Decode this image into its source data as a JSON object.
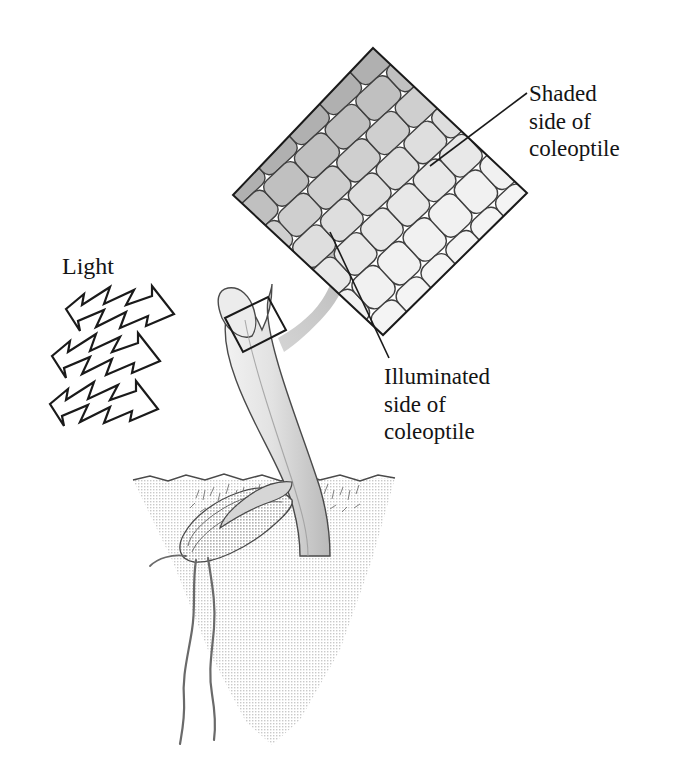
{
  "figure": {
    "labels": {
      "light": "Light",
      "shaded": "Shaded\nside of\ncoleoptile",
      "illuminated": "Illuminated\nside of\ncoleoptile"
    },
    "colors": {
      "outline": "#1a1a1a",
      "background": "#ffffff",
      "soil": "#e3e3e3",
      "plant": "#e0e0e0",
      "plant_shadow": "#b8b8b8",
      "seed": "#9d9d9d",
      "arrow_gray": "#bdbdbd",
      "cell_shaded": "#a8a8a8",
      "cell_mid": "#cfcfcf",
      "cell_illuminated": "#ededed"
    },
    "elements": {
      "light_arrows": 3,
      "inset_shape": "rotated-square",
      "cell_rows": 7,
      "roots": 2,
      "magnified_region_marker": "small rotated rectangle on coleoptile tip"
    }
  }
}
